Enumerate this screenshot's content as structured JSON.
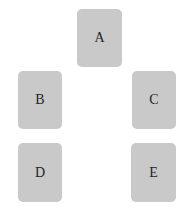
{
  "diagram": {
    "cards": [
      {
        "id": "A",
        "label": "A"
      },
      {
        "id": "B",
        "label": "B"
      },
      {
        "id": "C",
        "label": "C"
      },
      {
        "id": "D",
        "label": "D"
      },
      {
        "id": "E",
        "label": "E"
      }
    ],
    "card_color": "#c9c9c9",
    "text_color": "#1f1f1f",
    "background": "#ffffff"
  }
}
